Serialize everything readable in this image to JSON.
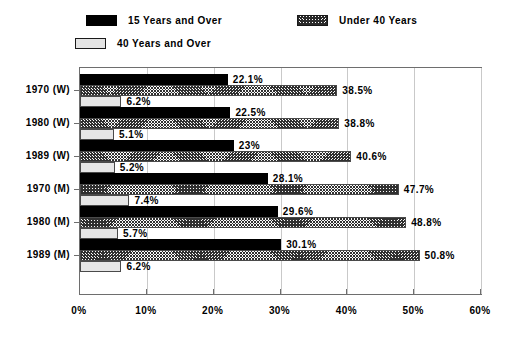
{
  "chart_data": {
    "type": "bar",
    "orientation": "horizontal",
    "title": "",
    "xlabel": "",
    "ylabel": "",
    "xlim": [
      0,
      60
    ],
    "xticks": [
      "0%",
      "10%",
      "20%",
      "30%",
      "40%",
      "50%",
      "60%"
    ],
    "xtick_values": [
      0,
      10,
      20,
      30,
      40,
      50,
      60
    ],
    "grid": true,
    "legend_position": "top",
    "categories": [
      "1970 (W)",
      "1980 (W)",
      "1989 (W)",
      "1970 (M)",
      "1980 (M)",
      "1989 (M)"
    ],
    "series": [
      {
        "name": "15 Years and Over",
        "fill": "black",
        "values": [
          22.1,
          22.5,
          23,
          28.1,
          29.6,
          30.1
        ],
        "labels": [
          "22.1%",
          "22.5%",
          "23%",
          "28.1%",
          "29.6%",
          "30.1%"
        ]
      },
      {
        "name": "Under 40 Years",
        "fill": "hatch",
        "values": [
          38.5,
          38.8,
          40.6,
          47.7,
          48.8,
          50.8
        ],
        "labels": [
          "38.5%",
          "38.8%",
          "40.6%",
          "47.7%",
          "48.8%",
          "50.8%"
        ]
      },
      {
        "name": "40 Years and Over",
        "fill": "stipple",
        "values": [
          6.2,
          5.1,
          5.2,
          7.4,
          5.7,
          6.2
        ],
        "labels": [
          "6.2%",
          "5.1%",
          "5.2%",
          "7.4%",
          "5.7%",
          "6.2%"
        ]
      }
    ]
  },
  "legend": {
    "items": [
      {
        "label": "15 Years and Over",
        "fill": "black"
      },
      {
        "label": "Under 40 Years",
        "fill": "hatch"
      },
      {
        "label": "40 Years and Over",
        "fill": "stipple"
      }
    ]
  },
  "colors": {
    "series_black": "#000000",
    "series_hatch": "#303030",
    "series_stipple": "#e6e6e6",
    "axis": "#6e6e6e",
    "gridline": "#c9c9c9",
    "background": "#ffffff"
  }
}
